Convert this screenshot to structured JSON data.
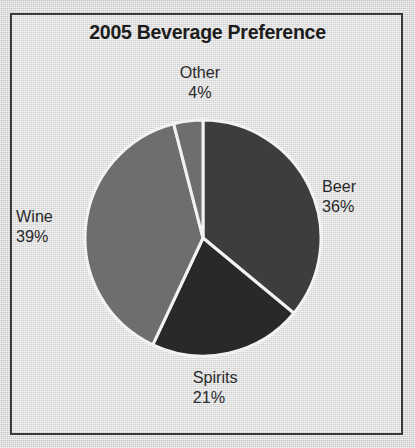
{
  "chart_data": {
    "type": "pie",
    "title": "2005 Beverage Preference",
    "categories": [
      "Beer",
      "Spirits",
      "Wine",
      "Other"
    ],
    "values": [
      36,
      21,
      39,
      4
    ],
    "value_suffix": "%",
    "labels": [
      {
        "name": "Beer",
        "value": "36%",
        "position": "right"
      },
      {
        "name": "Spirits",
        "value": "21%",
        "position": "bottom"
      },
      {
        "name": "Wine",
        "value": "39%",
        "position": "left"
      },
      {
        "name": "Other",
        "value": "4%",
        "position": "top"
      }
    ],
    "colors": [
      "#3d3d3d",
      "#292929",
      "#6e6e6e",
      "#6e6e6e"
    ],
    "start_angle_deg": 0,
    "direction": "clockwise",
    "separator_color": "#f2f2f2",
    "legend": "none",
    "grid": false,
    "xlabel": "",
    "ylabel": ""
  },
  "figure": {
    "frame_color": "#3a3a3a",
    "background_color": "#d9d9d9",
    "text_color": "#2a2a2a"
  },
  "pie_geometry": {
    "center_x": 120,
    "center_y": 120,
    "radius": 118,
    "slice_paths": [
      "M 120 120 L 120 2 A 118 118 0 0 1 227.3 170.0 Z",
      "M 120 120 L 227.3 170.0 A 118 118 0 0 1 52.1 225.2 Z",
      "M 120 120 L 52.1 225.2 A 118 118 0 0 1 94.5 4.9 Z",
      "M 120 120 L 94.5 4.9 A 118 118 0 0 1 120 2 Z"
    ]
  }
}
